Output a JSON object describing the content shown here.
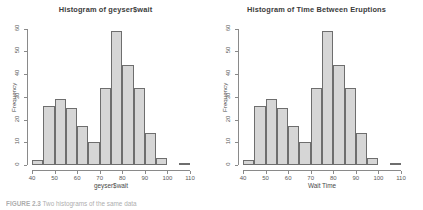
{
  "figure": {
    "caption_label": "FIGURE 2.3",
    "caption_rest": "  Two histograms of the same data",
    "background": "#ffffff",
    "bar_fill": "#d6d6d6",
    "bar_stroke": "#6e6e6e",
    "axis_color": "#8a8a8a"
  },
  "panels": [
    {
      "id": "left",
      "title": "Histogram of geyser$wait",
      "xlabel": "geyser$wait",
      "ylabel": "Frequency"
    },
    {
      "id": "right",
      "title": "Histogram of Time Between Eruptions",
      "xlabel": "Wait Time",
      "ylabel": "Frequency"
    }
  ],
  "axes": {
    "y_ticks": [
      "0",
      "10",
      "20",
      "30",
      "40",
      "50",
      "60"
    ],
    "y_tick_values": [
      0,
      10,
      20,
      30,
      40,
      50,
      60
    ],
    "x_ticks": [
      "40",
      "50",
      "60",
      "70",
      "80",
      "90",
      "100",
      "110"
    ],
    "x_tick_values": [
      40,
      50,
      60,
      70,
      80,
      90,
      100,
      110
    ]
  },
  "chart_data": [
    {
      "type": "bar",
      "title": "Histogram of geyser$wait",
      "xlabel": "geyser$wait",
      "ylabel": "Frequency",
      "xlim": [
        40,
        110
      ],
      "ylim": [
        0,
        62
      ],
      "grid": false,
      "legend": "none",
      "bin_width": 5,
      "bin_edges": [
        40,
        45,
        50,
        55,
        60,
        65,
        70,
        75,
        80,
        85,
        90,
        95,
        100,
        105,
        110
      ],
      "categories": [
        "40-45",
        "45-50",
        "50-55",
        "55-60",
        "60-65",
        "65-70",
        "70-75",
        "75-80",
        "80-85",
        "85-90",
        "90-95",
        "95-100",
        "100-105",
        "105-110"
      ],
      "values": [
        2,
        26,
        29,
        25,
        17,
        10,
        34,
        59,
        44,
        34,
        14,
        3,
        0,
        1
      ]
    },
    {
      "type": "bar",
      "title": "Histogram of Time Between Eruptions",
      "xlabel": "Wait Time",
      "ylabel": "Frequency",
      "xlim": [
        40,
        110
      ],
      "ylim": [
        0,
        62
      ],
      "grid": false,
      "legend": "none",
      "bin_width": 5,
      "bin_edges": [
        40,
        45,
        50,
        55,
        60,
        65,
        70,
        75,
        80,
        85,
        90,
        95,
        100,
        105,
        110
      ],
      "categories": [
        "40-45",
        "45-50",
        "50-55",
        "55-60",
        "60-65",
        "65-70",
        "70-75",
        "75-80",
        "80-85",
        "85-90",
        "90-95",
        "95-100",
        "100-105",
        "105-110"
      ],
      "values": [
        2,
        26,
        29,
        25,
        17,
        10,
        34,
        59,
        44,
        34,
        14,
        3,
        0,
        1
      ]
    }
  ]
}
